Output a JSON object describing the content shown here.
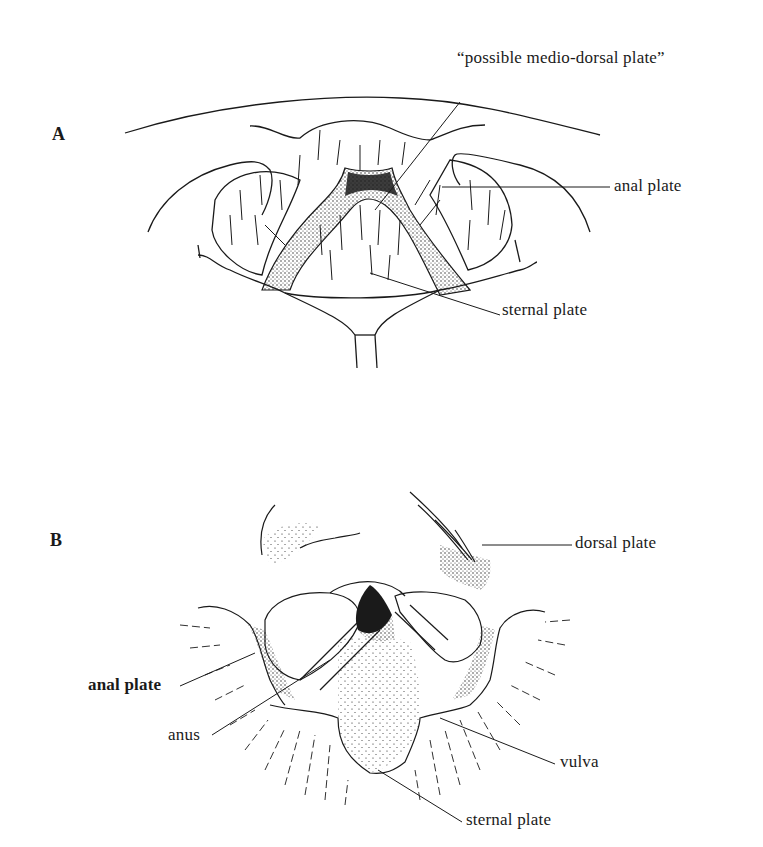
{
  "figure": {
    "panels": [
      {
        "id": "A",
        "letter": "A",
        "labels": {
          "medio_dorsal": "“possible medio-dorsal plate”",
          "anal_plate": "anal plate",
          "sternal_plate": "sternal plate"
        }
      },
      {
        "id": "B",
        "letter": "B",
        "labels": {
          "dorsal_plate": "dorsal plate",
          "anal_plate": "anal plate",
          "anus": "anus",
          "vulva": "vulva",
          "sternal_plate": "sternal plate"
        }
      }
    ],
    "colors": {
      "ink": "#1a1a1a",
      "background": "#ffffff"
    }
  }
}
